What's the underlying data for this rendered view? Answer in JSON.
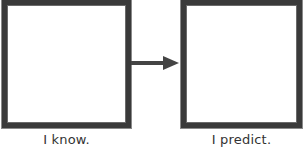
{
  "diagram": {
    "type": "flow",
    "nodes": [
      {
        "id": "left",
        "label": "I know.",
        "content": ""
      },
      {
        "id": "right",
        "label": "I predict.",
        "content": ""
      }
    ],
    "edges": [
      {
        "from": "left",
        "to": "right",
        "style": "arrow"
      }
    ],
    "colors": {
      "border": "#3a3a3a",
      "arrow": "#444444",
      "background": "#ffffff",
      "text": "#333333"
    }
  }
}
